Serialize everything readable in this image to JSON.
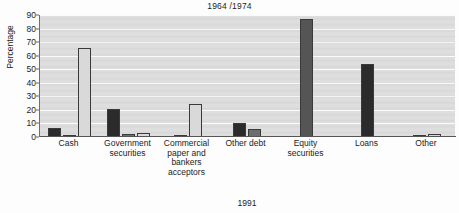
{
  "chart_data": {
    "type": "bar",
    "title": "1964 /1974",
    "subtitle": "",
    "xlabel": "",
    "ylabel": "Percentage",
    "bottom_caption": "1991",
    "ylim": [
      0,
      90
    ],
    "ytick_step": 10,
    "yticks": [
      90,
      80,
      70,
      60,
      50,
      40,
      30,
      20,
      10,
      0
    ],
    "grid": true,
    "grid_orientation": "horizontal",
    "legend": "none",
    "legend_position": "none",
    "categories": [
      "Cash",
      "Government securities",
      "Commercial paper and bankers acceptors",
      "Other debt",
      "Equity securities",
      "Loans",
      "Other"
    ],
    "series": [
      {
        "name": "1964",
        "color": "#2b2b2b",
        "values": [
          7,
          21,
          1.5,
          10,
          87,
          54,
          1
        ]
      },
      {
        "name": "1974",
        "color": "#6e6e6e",
        "values": [
          1,
          2,
          null,
          6,
          null,
          null,
          null
        ]
      },
      {
        "name": "1991",
        "color": "#d9d9d9",
        "values": [
          66,
          3,
          24,
          null,
          null,
          null,
          2
        ]
      }
    ],
    "bars": [
      {
        "category": "Cash",
        "items": [
          {
            "value": 7,
            "shade": "dark"
          },
          {
            "value": 1,
            "shade": "dark"
          },
          {
            "value": 66,
            "shade": "light"
          }
        ]
      },
      {
        "category": "Government securities",
        "items": [
          {
            "value": 21,
            "shade": "dark"
          },
          {
            "value": 2,
            "shade": "mid"
          },
          {
            "value": 3,
            "shade": "light"
          }
        ]
      },
      {
        "category": "Commercial paper and bankers acceptors",
        "items": [
          {
            "value": 1.5,
            "shade": "dark"
          },
          {
            "value": 24,
            "shade": "light"
          }
        ]
      },
      {
        "category": "Other debt",
        "items": [
          {
            "value": 10,
            "shade": "dark"
          },
          {
            "value": 6,
            "shade": "mid"
          }
        ]
      },
      {
        "category": "Equity securities",
        "items": [
          {
            "value": 87,
            "shade": "mid-dark"
          }
        ]
      },
      {
        "category": "Loans",
        "items": [
          {
            "value": 54,
            "shade": "dark"
          }
        ]
      },
      {
        "category": "Other",
        "items": [
          {
            "value": 1,
            "shade": "dark"
          },
          {
            "value": 2,
            "shade": "light"
          }
        ]
      }
    ]
  },
  "palette": {
    "dark": "#2b2b2b",
    "mid_dark": "#555555",
    "mid": "#6e6e6e",
    "light": "#d9d9d9",
    "plot_background": "#dedede",
    "gridline": "#fbfbfb",
    "axis": "#555555",
    "text": "#1c1c1c"
  }
}
